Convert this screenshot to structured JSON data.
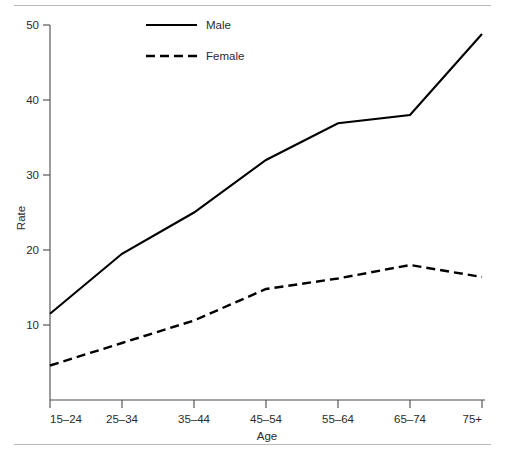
{
  "chart_data": {
    "type": "line",
    "title": "",
    "xlabel": "Age",
    "ylabel": "Rate",
    "categories": [
      "15–24",
      "25–34",
      "35–44",
      "45–54",
      "55–64",
      "65–74",
      "75+"
    ],
    "yticks": [
      10,
      20,
      30,
      40,
      50
    ],
    "ytick_labels": [
      "10",
      "20",
      "30",
      "40",
      "50"
    ],
    "ylim": [
      0,
      50
    ],
    "grid": false,
    "legend_position": "top-center",
    "series": [
      {
        "name": "Male",
        "style": "solid",
        "color": "#000000",
        "values": [
          11.5,
          19.5,
          25.0,
          32.0,
          36.9,
          38.0,
          48.8
        ]
      },
      {
        "name": "Female",
        "style": "dashed",
        "color": "#000000",
        "values": [
          4.6,
          7.6,
          10.6,
          14.8,
          16.2,
          18.0,
          16.4
        ]
      }
    ]
  },
  "legend": {
    "items": [
      {
        "label": "Male",
        "style": "solid"
      },
      {
        "label": "Female",
        "style": "dashed"
      }
    ]
  },
  "axes": {
    "y_title": "Rate",
    "x_title": "Age"
  }
}
